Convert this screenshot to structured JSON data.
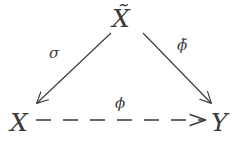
{
  "diagram": {
    "type": "commutative-triangle",
    "background_color": "#ffffff",
    "ink_color": "#3a3a3a",
    "nodes": [
      {
        "id": "top",
        "label": "X̃",
        "base": "X",
        "accent": "tilde",
        "position": "top-center"
      },
      {
        "id": "left",
        "label": "X",
        "base": "X",
        "accent": "none",
        "position": "bottom-left"
      },
      {
        "id": "right",
        "label": "Y",
        "base": "Y",
        "accent": "none",
        "position": "bottom-right"
      }
    ],
    "edges": [
      {
        "id": "sigma",
        "label": "σ",
        "from": "top",
        "to": "left",
        "style": "solid",
        "arrowhead": "end",
        "direction": "down-left"
      },
      {
        "id": "phi-tilde",
        "label": "ϕ̃",
        "from": "top",
        "to": "right",
        "style": "solid",
        "arrowhead": "end",
        "direction": "down-right"
      },
      {
        "id": "phi",
        "label": "ϕ",
        "from": "left",
        "to": "right",
        "style": "dashed",
        "arrowhead": "end",
        "direction": "right",
        "dash_count": 6
      }
    ]
  }
}
